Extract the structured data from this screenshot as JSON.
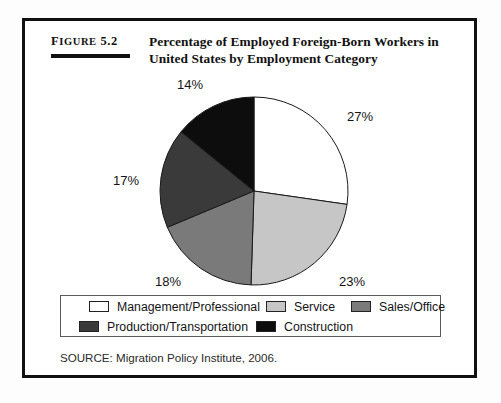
{
  "figure": {
    "number_prefix": "F",
    "number_caps": "IGURE",
    "number_value": "5.2",
    "number_full": "Figure 5.2",
    "title_line_1": "Percentage of Employed Foreign-Born Workers in",
    "title_line_2": "United States by Employment Category",
    "source": "SOURCE: Migration Policy Institute, 2006."
  },
  "chart_data": {
    "type": "pie",
    "title": "Percentage of Employed Foreign-Born Workers in United States by Employment Category",
    "categories": [
      "Management/Professional",
      "Service",
      "Sales/Office",
      "Production/Transportation",
      "Construction"
    ],
    "values": [
      27,
      23,
      18,
      17,
      14
    ],
    "value_labels": [
      "27%",
      "23%",
      "18%",
      "17%",
      "14%"
    ],
    "colors": [
      "#ffffff",
      "#c6c6c6",
      "#7a7a7a",
      "#3a3a3a",
      "#0d0d0d"
    ],
    "start_angle_deg": 0,
    "direction": "clockwise",
    "legend_position": "bottom",
    "grid": false,
    "units": "percent",
    "source": "Migration Policy Institute, 2006."
  },
  "legend": {
    "row_1": [
      {
        "label": "Management/Professional",
        "color": "#ffffff"
      },
      {
        "label": "Service",
        "color": "#c6c6c6"
      },
      {
        "label": "Sales/Office",
        "color": "#7a7a7a"
      }
    ],
    "row_2": [
      {
        "label": "Production/Transportation",
        "color": "#3a3a3a"
      },
      {
        "label": "Construction",
        "color": "#0d0d0d"
      }
    ]
  },
  "slice_labels": [
    {
      "text": "27%",
      "left": "322px",
      "top": "88px"
    },
    {
      "text": "23%",
      "left": "314px",
      "top": "253px"
    },
    {
      "text": "18%",
      "left": "130px",
      "top": "253px"
    },
    {
      "text": "17%",
      "left": "88px",
      "top": "152px"
    },
    {
      "text": "14%",
      "left": "152px",
      "top": "56px"
    }
  ]
}
